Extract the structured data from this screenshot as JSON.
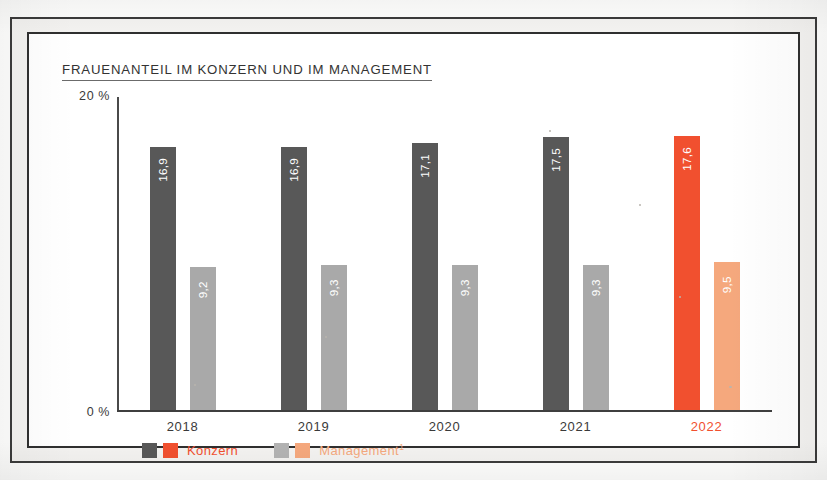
{
  "chart_title": "FRAUENANTEIL IM KONZERN UND IM MANAGEMENT",
  "colors": {
    "konzern_gray": "#585858",
    "management_gray": "#a9a9a9",
    "konzern_highlight": "#f1502f",
    "management_highlight": "#f5a87d",
    "axis": "#3f3f3f",
    "label_gray": "#3a3a3a"
  },
  "axis": {
    "y_top_label": "20 %",
    "y_zero_label": "0 %"
  },
  "legend": {
    "items": [
      {
        "label": "Konzern",
        "sup": "",
        "swatch_gray": "#585858",
        "swatch_accent": "#f1502f",
        "label_color": "#f1502f"
      },
      {
        "label": "Management",
        "sup": "1",
        "swatch_gray": "#b3b3b3",
        "swatch_accent": "#f5a87d",
        "label_color": "#f5a87d"
      }
    ]
  },
  "chart_data": {
    "type": "bar",
    "title": "FRAUENANTEIL IM KONZERN UND IM MANAGEMENT",
    "xlabel": "",
    "ylabel": "%",
    "ylim": [
      0,
      20
    ],
    "grid": false,
    "legend_position": "bottom-left",
    "categories": [
      "2018",
      "2019",
      "2020",
      "2021",
      "2022"
    ],
    "highlight_category": "2022",
    "series": [
      {
        "name": "Konzern",
        "values": [
          16.9,
          16.9,
          17.1,
          17.5,
          17.6
        ],
        "labels": [
          "16,9",
          "16,9",
          "17,1",
          "17,5",
          "17,6"
        ]
      },
      {
        "name": "Management",
        "values": [
          9.2,
          9.3,
          9.3,
          9.3,
          9.5
        ],
        "labels": [
          "9,2",
          "9,3",
          "9,3",
          "9,3",
          "9,5"
        ]
      }
    ],
    "annotations": [
      "Management footnote marker 1"
    ]
  }
}
